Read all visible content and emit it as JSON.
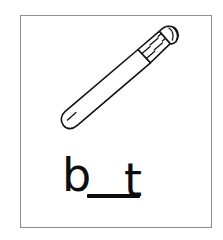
{
  "card": {
    "title": "Missing letter phonics card",
    "frame_color": "#8d8d93",
    "background_color": "#ffffff"
  },
  "illustration": {
    "name": "baseball-bat",
    "alt_text": "Line drawing of a baseball bat",
    "line_color": "#111111",
    "fill_color": "#ffffff",
    "orientation": "diagonal, barrel lower-left, handle knob upper-right",
    "parts": [
      "barrel",
      "taper",
      "grip-hatching",
      "knob"
    ]
  },
  "word_puzzle": {
    "answer_pattern": "b __ t",
    "first_letter": "b",
    "last_letter": "t",
    "blank_label": "",
    "ink_color": "#0d0d0d"
  }
}
